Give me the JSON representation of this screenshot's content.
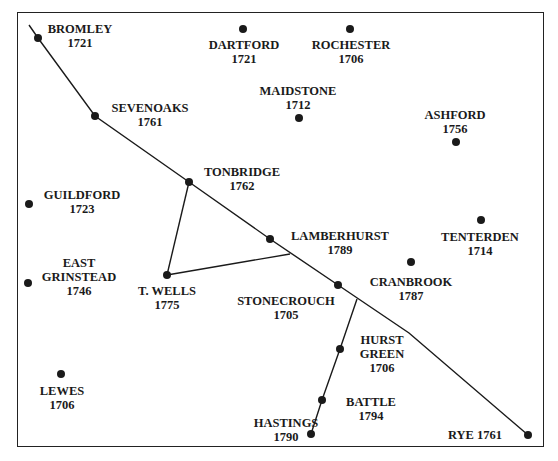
{
  "map": {
    "colors": {
      "ink": "#1a1a1a",
      "border": "#222222",
      "background": "#ffffff"
    },
    "towns": [
      {
        "name": "BROMLEY",
        "year": "1721",
        "dot": [
          38,
          38
        ],
        "label": [
          80,
          22
        ],
        "lines": [
          "BROMLEY",
          "1721"
        ]
      },
      {
        "name": "DARTFORD",
        "year": "1721",
        "dot": [
          243,
          29
        ],
        "label": [
          244,
          38
        ],
        "lines": [
          "DARTFORD",
          "1721"
        ]
      },
      {
        "name": "ROCHESTER",
        "year": "1706",
        "dot": [
          350,
          29
        ],
        "label": [
          351,
          38
        ],
        "lines": [
          "ROCHESTER",
          "1706"
        ]
      },
      {
        "name": "MAIDSTONE",
        "year": "1712",
        "dot": [
          299,
          118
        ],
        "label": [
          298,
          84
        ],
        "lines": [
          "MAIDSTONE",
          "1712"
        ]
      },
      {
        "name": "ASHFORD",
        "year": "1756",
        "dot": [
          456,
          142
        ],
        "label": [
          455,
          108
        ],
        "lines": [
          "ASHFORD",
          "1756"
        ]
      },
      {
        "name": "SEVENOAKS",
        "year": "1761",
        "dot": [
          95,
          116
        ],
        "label": [
          150,
          101
        ],
        "lines": [
          "SEVENOAKS",
          "1761"
        ]
      },
      {
        "name": "TONBRIDGE",
        "year": "1762",
        "dot": [
          189,
          182
        ],
        "label": [
          242,
          165
        ],
        "lines": [
          "TONBRIDGE",
          "1762"
        ]
      },
      {
        "name": "GUILDFORD",
        "year": "1723",
        "dot": [
          29,
          204
        ],
        "label": [
          82,
          188
        ],
        "lines": [
          "GUILDFORD",
          "1723"
        ]
      },
      {
        "name": "LAMBERHURST",
        "year": "1789",
        "dot": [
          270,
          239
        ],
        "label": [
          340,
          229
        ],
        "lines": [
          "LAMBERHURST",
          "1789"
        ]
      },
      {
        "name": "TENTERDEN",
        "year": "1714",
        "dot": [
          481,
          220
        ],
        "label": [
          480,
          230
        ],
        "lines": [
          "TENTERDEN",
          "1714"
        ]
      },
      {
        "name": "CRANBROOK",
        "year": "1787",
        "dot": [
          411,
          262
        ],
        "label": [
          411,
          275
        ],
        "lines": [
          "CRANBROOK",
          "1787"
        ]
      },
      {
        "name": "EAST GRINSTEAD",
        "year": "1746",
        "dot": [
          28,
          283
        ],
        "label": [
          79,
          256
        ],
        "lines": [
          "EAST",
          "GRINSTEAD",
          "1746"
        ]
      },
      {
        "name": "T. WELLS",
        "year": "1775",
        "dot": [
          167,
          275
        ],
        "label": [
          167,
          284
        ],
        "lines": [
          "T. WELLS",
          "1775"
        ]
      },
      {
        "name": "STONECROUCH",
        "year": "1705",
        "dot": [
          338,
          285
        ],
        "label": [
          286,
          294
        ],
        "lines": [
          "STONECROUCH",
          "1705"
        ]
      },
      {
        "name": "HURST GREEN",
        "year": "1706",
        "dot": [
          340,
          349
        ],
        "label": [
          382,
          333
        ],
        "lines": [
          "HURST",
          "GREEN",
          "1706"
        ]
      },
      {
        "name": "LEWES",
        "year": "1706",
        "dot": [
          61,
          374
        ],
        "label": [
          62,
          384
        ],
        "lines": [
          "LEWES",
          "1706"
        ]
      },
      {
        "name": "BATTLE",
        "year": "1794",
        "dot": [
          322,
          400
        ],
        "label": [
          371,
          395
        ],
        "lines": [
          "BATTLE",
          "1794"
        ]
      },
      {
        "name": "HASTINGS",
        "year": "1790",
        "dot": [
          311,
          434
        ],
        "label": [
          286,
          416
        ],
        "lines": [
          "HASTINGS",
          "1790"
        ]
      },
      {
        "name": "RYE",
        "year": "1761",
        "dot": [
          528,
          435
        ],
        "label": [
          475,
          428
        ],
        "lines": [
          "RYE 1761"
        ]
      }
    ],
    "roads": [
      {
        "name": "london-rye-road",
        "points": [
          [
            29,
            25
          ],
          [
            38,
            38
          ],
          [
            95,
            116
          ],
          [
            189,
            182
          ],
          [
            270,
            239
          ],
          [
            338,
            285
          ],
          [
            409,
            333
          ],
          [
            528,
            435
          ]
        ]
      },
      {
        "name": "tonbridge-twells-road",
        "points": [
          [
            189,
            182
          ],
          [
            167,
            275
          ]
        ]
      },
      {
        "name": "twells-lamberhurst-road",
        "points": [
          [
            167,
            275
          ],
          [
            290,
            254
          ]
        ]
      },
      {
        "name": "stonecrouch-hastings-road",
        "points": [
          [
            357,
            299
          ],
          [
            340,
            349
          ],
          [
            322,
            400
          ],
          [
            311,
            434
          ]
        ]
      }
    ]
  }
}
